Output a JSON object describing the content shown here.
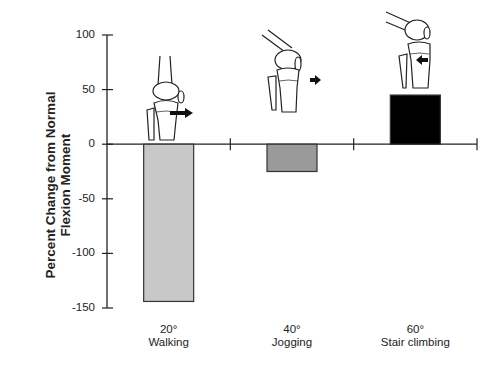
{
  "chart_data": {
    "type": "bar",
    "title": "",
    "xlabel": "",
    "ylabel": "Percent Change from Normal Flexion Moment",
    "ylabel_lines": [
      "Percent Change  from Normal",
      "Flexion Moment"
    ],
    "ylim": [
      -150,
      100
    ],
    "yticks": [
      100,
      50,
      0,
      -50,
      -100,
      -150
    ],
    "categories": [
      {
        "angle": "20°",
        "activity": "Walking"
      },
      {
        "angle": "40°",
        "activity": "Jogging"
      },
      {
        "angle": "60°",
        "activity": "Stair climbing"
      }
    ],
    "values": [
      -144,
      -25,
      45
    ],
    "colors": [
      "#c8c8c8",
      "#9a9a9a",
      "#000000"
    ],
    "grid": false,
    "legend": null,
    "annotations": [
      "knee-illustration-20deg-flexion with anterior arrow",
      "knee-illustration-40deg-flexion with anterior arrow",
      "knee-illustration-60deg-flexion with posterior arrow"
    ]
  }
}
